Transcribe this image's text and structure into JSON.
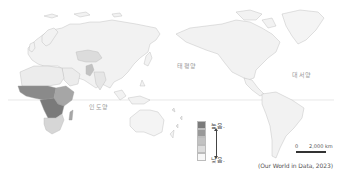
{
  "map": {
    "title": "",
    "projection": "Pacific-centered world map",
    "colors": {
      "background": "#ffffff",
      "land_default": "#f2f2f2",
      "border": "#b5b5b5",
      "equator": "#d8d8d8",
      "shade_1_highest": "#7a7a7a",
      "shade_2": "#999999",
      "shade_3": "#c2c2c2",
      "shade_4": "#dcdcdc",
      "shade_5_lowest": "#f2f2f2"
    },
    "ocean_labels": {
      "pacific": "태평양",
      "atlantic": "대서양",
      "indian": "인도양"
    },
    "legend": {
      "high_label": "높음.",
      "low_label": "낮음.",
      "classes": 5,
      "swatches": [
        "#7a7a7a",
        "#999999",
        "#c2c2c2",
        "#dcdcdc",
        "#f7f7f7"
      ]
    },
    "scale": {
      "zero": "0",
      "max": "2,000 km"
    },
    "source": "(Our World in Data, 2023)"
  }
}
